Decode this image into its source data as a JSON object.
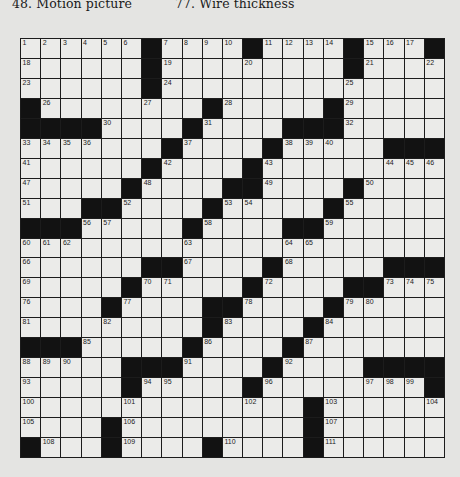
{
  "clues_visible": [
    {
      "number": "48",
      "text": "48. Motion picture"
    },
    {
      "number": "77",
      "text": "77. Wire thickness"
    }
  ],
  "puzzle": {
    "rows": 21,
    "cols": 21,
    "colors": {
      "block": "#121212",
      "cell": "#ebebe9",
      "line": "#1c1c1c",
      "page": "#e4e4e2"
    },
    "grid": [
      [
        "1",
        "2",
        "3",
        "4",
        "5",
        "6",
        "#",
        "7",
        "8",
        "9",
        "10",
        "#",
        "11",
        "12",
        "13",
        "14",
        "#",
        "15",
        "16",
        "17",
        "#"
      ],
      [
        "18",
        ".",
        ".",
        ".",
        ".",
        ".",
        "#",
        "19",
        ".",
        ".",
        ".",
        "20",
        ".",
        ".",
        ".",
        ".",
        "#",
        "21",
        ".",
        ".",
        "22"
      ],
      [
        "23",
        ".",
        ".",
        ".",
        ".",
        ".",
        "#",
        "24",
        ".",
        ".",
        ".",
        ".",
        ".",
        ".",
        ".",
        ".",
        "25",
        ".",
        ".",
        ".",
        "."
      ],
      [
        "#",
        "26",
        ".",
        ".",
        ".",
        ".",
        "27",
        ".",
        ".",
        "#",
        "28",
        ".",
        ".",
        ".",
        ".",
        "#",
        "29",
        ".",
        ".",
        ".",
        "."
      ],
      [
        "#",
        "#",
        "#",
        "#",
        "30",
        ".",
        ".",
        ".",
        "#",
        "31",
        ".",
        ".",
        ".",
        "#",
        "#",
        "#",
        "32",
        ".",
        ".",
        ".",
        "."
      ],
      [
        "33",
        "34",
        "35",
        "36",
        ".",
        ".",
        ".",
        "#",
        "37",
        ".",
        ".",
        ".",
        "#",
        "38",
        "39",
        "40",
        ".",
        ".",
        "#",
        "#",
        "#"
      ],
      [
        "41",
        ".",
        ".",
        ".",
        ".",
        ".",
        "#",
        "42",
        ".",
        ".",
        ".",
        "#",
        "43",
        ".",
        ".",
        ".",
        ".",
        ".",
        "44",
        "45",
        "46"
      ],
      [
        "47",
        ".",
        ".",
        ".",
        ".",
        "#",
        "48",
        ".",
        ".",
        ".",
        "#",
        "#",
        "49",
        ".",
        ".",
        ".",
        "#",
        "50",
        ".",
        ".",
        "."
      ],
      [
        "51",
        ".",
        ".",
        "#",
        "#",
        "52",
        ".",
        ".",
        ".",
        "#",
        "53",
        "54",
        ".",
        ".",
        ".",
        "#",
        "55",
        ".",
        ".",
        ".",
        "."
      ],
      [
        "#",
        "#",
        "#",
        "56",
        "57",
        ".",
        ".",
        ".",
        "#",
        "58",
        ".",
        ".",
        ".",
        "#",
        "#",
        "59",
        ".",
        ".",
        ".",
        ".",
        "."
      ],
      [
        "60",
        "61",
        "62",
        ".",
        ".",
        ".",
        ".",
        ".",
        "63",
        ".",
        ".",
        ".",
        ".",
        "64",
        "65",
        ".",
        ".",
        ".",
        ".",
        ".",
        "."
      ],
      [
        "66",
        ".",
        ".",
        ".",
        ".",
        ".",
        "#",
        "#",
        "67",
        ".",
        ".",
        ".",
        "#",
        "68",
        ".",
        ".",
        ".",
        ".",
        "#",
        "#",
        "#"
      ],
      [
        "69",
        ".",
        ".",
        ".",
        ".",
        "#",
        "70",
        "71",
        ".",
        ".",
        ".",
        "#",
        "72",
        ".",
        ".",
        ".",
        "#",
        "#",
        "73",
        "74",
        "75"
      ],
      [
        "76",
        ".",
        ".",
        ".",
        "#",
        "77",
        ".",
        ".",
        ".",
        "#",
        "#",
        "78",
        ".",
        ".",
        ".",
        "#",
        "79",
        "80",
        ".",
        ".",
        "."
      ],
      [
        "81",
        ".",
        ".",
        ".",
        "82",
        ".",
        ".",
        ".",
        ".",
        "#",
        "83",
        ".",
        ".",
        ".",
        "#",
        "84",
        ".",
        ".",
        ".",
        ".",
        "."
      ],
      [
        "#",
        "#",
        "#",
        "85",
        ".",
        ".",
        ".",
        ".",
        "#",
        "86",
        ".",
        ".",
        ".",
        "#",
        "87",
        ".",
        ".",
        ".",
        ".",
        ".",
        "."
      ],
      [
        "88",
        "89",
        "90",
        ".",
        ".",
        "#",
        "#",
        "#",
        "91",
        ".",
        ".",
        ".",
        "#",
        "92",
        ".",
        ".",
        ".",
        "#",
        "#",
        "#",
        "#"
      ],
      [
        "93",
        ".",
        ".",
        ".",
        ".",
        "#",
        "94",
        "95",
        ".",
        ".",
        ".",
        "#",
        "96",
        ".",
        ".",
        ".",
        ".",
        "97",
        "98",
        "99",
        "#"
      ],
      [
        "100",
        ".",
        ".",
        ".",
        ".",
        "101",
        ".",
        ".",
        ".",
        ".",
        ".",
        "102",
        ".",
        ".",
        "#",
        "103",
        ".",
        ".",
        ".",
        ".",
        "104"
      ],
      [
        "105",
        ".",
        ".",
        ".",
        "#",
        "106",
        ".",
        ".",
        ".",
        ".",
        ".",
        ".",
        ".",
        ".",
        "#",
        "107",
        ".",
        ".",
        ".",
        ".",
        "."
      ],
      [
        "#",
        "108",
        ".",
        ".",
        "#",
        "109",
        ".",
        ".",
        ".",
        "#",
        "110",
        ".",
        ".",
        ".",
        "#",
        "111",
        ".",
        ".",
        ".",
        ".",
        "."
      ]
    ]
  }
}
